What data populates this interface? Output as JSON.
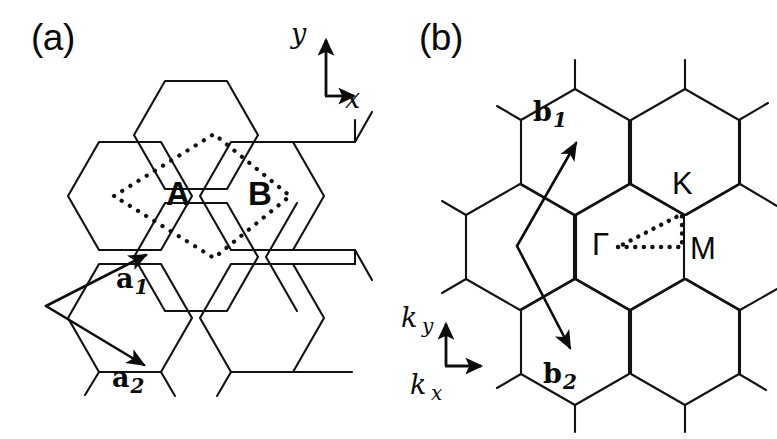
{
  "figure": {
    "type": "scientific-diagram",
    "background_color": "#ffffff",
    "line_color": "#121212",
    "width": 777,
    "height": 439
  },
  "panel_a": {
    "label": "(a)",
    "space": "real space",
    "sublattice_sites": [
      {
        "name": "A",
        "label": "A",
        "x": 166,
        "y": 196
      },
      {
        "name": "B",
        "label": "B",
        "x": 248,
        "y": 196
      }
    ],
    "lattice_vectors": [
      {
        "name": "a1",
        "base": "a",
        "sub": "1",
        "from": [
          46,
          306
        ],
        "to": [
          148,
          254
        ]
      },
      {
        "name": "a2",
        "base": "a",
        "sub": "2",
        "from": [
          46,
          306
        ],
        "to": [
          146,
          366
        ]
      }
    ],
    "vector_labels": [
      {
        "name": "a1",
        "base": "a",
        "sub": "1",
        "x": 116,
        "y": 279
      },
      {
        "name": "a2",
        "base": "a",
        "sub": "2",
        "x": 112,
        "y": 378
      }
    ],
    "unit_cell": {
      "style": "dotted rhombus",
      "vertices": [
        [
          114,
          196
        ],
        [
          214,
          134
        ],
        [
          290,
          196
        ],
        [
          214,
          258
        ]
      ]
    },
    "axes": {
      "origin": [
        326,
        96
      ],
      "y_label": "y",
      "x_label": "x",
      "y_tip": [
        326,
        34
      ],
      "x_tip": [
        360,
        96
      ],
      "y_label_pos": [
        292,
        22
      ],
      "x_label_pos": [
        345,
        95
      ]
    },
    "hexagon_geometry": {
      "orientation": "flat-top",
      "circumradius": 62,
      "centers": [
        [
          196,
          135
        ],
        [
          130,
          196
        ],
        [
          262,
          196
        ],
        [
          196,
          258
        ],
        [
          131,
          318
        ],
        [
          263,
          318
        ],
        [
          328,
          258
        ],
        [
          328,
          135
        ]
      ]
    }
  },
  "panel_b": {
    "label": "(b)",
    "space": "reciprocal space",
    "high_symmetry_points": [
      {
        "name": "Gamma",
        "label": "Γ",
        "x": 596,
        "y": 245
      },
      {
        "name": "M",
        "label": "M",
        "x": 691,
        "y": 249
      },
      {
        "name": "K",
        "label": "K",
        "x": 677,
        "y": 186
      }
    ],
    "path": {
      "style": "dotted triangle",
      "sequence": [
        "Γ",
        "M",
        "K",
        "Γ"
      ],
      "vertices": [
        [
          618,
          247
        ],
        [
          682,
          247
        ],
        [
          682,
          214
        ]
      ]
    },
    "reciprocal_vectors": [
      {
        "name": "b1",
        "base": "b",
        "sub": "1",
        "from": [
          517,
          246
        ],
        "to": [
          578,
          139
        ]
      },
      {
        "name": "b2",
        "base": "b",
        "sub": "2",
        "from": [
          517,
          246
        ],
        "to": [
          572,
          352
        ]
      }
    ],
    "vector_labels": [
      {
        "name": "b1",
        "base": "b",
        "sub": "1",
        "x": 538,
        "y": 110
      },
      {
        "name": "b2",
        "base": "b",
        "sub": "2",
        "x": 546,
        "y": 372
      }
    ],
    "axes": {
      "origin": [
        446,
        366
      ],
      "y_label_lead": "k",
      "y_label_sub": "y",
      "x_label_lead": "k",
      "x_label_sub": "x",
      "y_tip": [
        446,
        318
      ],
      "x_tip": [
        487,
        366
      ],
      "y_label_pos": [
        400,
        305
      ],
      "x_label_pos": [
        408,
        372
      ]
    },
    "hexagon_geometry": {
      "orientation": "pointy-top",
      "circumradius": 63,
      "centers": [
        [
          630,
          247
        ],
        [
          575,
          152
        ],
        [
          685,
          152
        ],
        [
          520,
          247
        ],
        [
          575,
          342
        ],
        [
          685,
          342
        ],
        [
          740,
          247
        ],
        [
          740,
          152
        ]
      ]
    }
  }
}
